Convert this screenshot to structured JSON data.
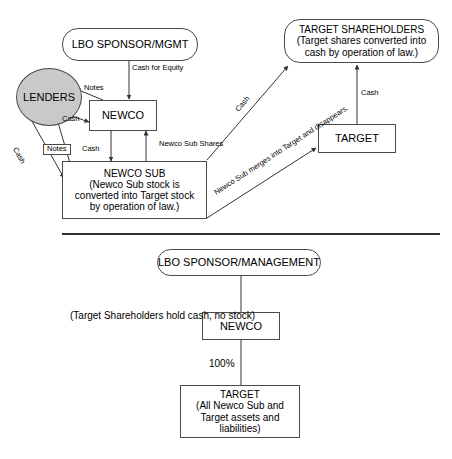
{
  "diagram": {
    "stroke_color": "#4a4a4a",
    "lenders_fill": "#c9c9c9",
    "background": "#ffffff"
  },
  "top_panel": {
    "nodes": {
      "lbo_sponsor": {
        "line1": "LBO SPONSOR/MGMT"
      },
      "lenders": {
        "line1": "LENDERS"
      },
      "newco": {
        "line1": "NEWCO"
      },
      "newco_sub": {
        "line1": "NEWCO SUB",
        "line2": "(Newco Sub stock is",
        "line3": "converted into Target stock",
        "line4": "by operation of law.)"
      },
      "target_shareholders": {
        "line1": "TARGET SHAREHOLDERS",
        "line2": "(Target shares converted into",
        "line3": "cash by operation of law.)"
      },
      "target": {
        "line1": "TARGET"
      }
    },
    "edge_labels": {
      "cash_for_equity_l1": "Cash",
      "cash_for_equity_l2": "for",
      "cash_for_equity_l3": "Equity",
      "notes_to_lenders": "Notes",
      "cash_to_lenders": "Cash",
      "notes_boxed": "Notes",
      "cash_newco_to_sub": "Cash",
      "cash_diagonal_lenders": "Cash",
      "newco_sub_shares_l1": "Newco",
      "newco_sub_shares_l2": "Sub Shares",
      "cash_to_shareholders": "Cash",
      "cash_target_to_shareholders": "Cash",
      "merge_note_l1": "Newco Sub merges into",
      "merge_note_l2": "Target and disappears."
    }
  },
  "bottom_panel": {
    "nodes": {
      "lbo_sponsor_management": {
        "line1": "LBO SPONSOR/MANAGEMENT"
      },
      "newco": {
        "line1": "NEWCO"
      },
      "target": {
        "line1": "TARGET",
        "line2": "(All Newco Sub and",
        "line3": "Target assets and",
        "line4": "liabilities)"
      }
    },
    "edge_labels": {
      "ownership_percent": "100%"
    },
    "annotations": {
      "shareholders_note_l1": "(Target",
      "shareholders_note_l2": "Shareholders hold",
      "shareholders_note_l3": "cash, no stock)"
    }
  }
}
